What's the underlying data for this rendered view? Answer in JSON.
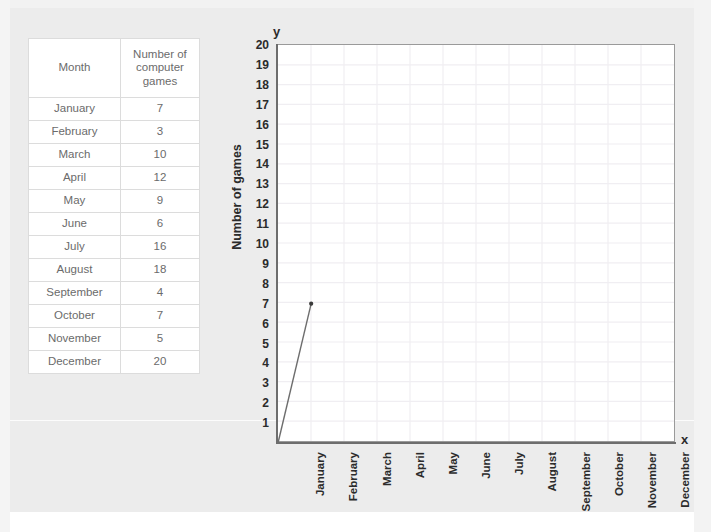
{
  "table": {
    "headers": [
      "Month",
      "Number of computer games"
    ],
    "header_month": "Month",
    "header_value_line1": "Number of",
    "header_value_line2": "computer",
    "header_value_line3": "games",
    "rows": [
      {
        "month": "January",
        "value": "7"
      },
      {
        "month": "February",
        "value": "3"
      },
      {
        "month": "March",
        "value": "10"
      },
      {
        "month": "April",
        "value": "12"
      },
      {
        "month": "May",
        "value": "9"
      },
      {
        "month": "June",
        "value": "6"
      },
      {
        "month": "July",
        "value": "16"
      },
      {
        "month": "August",
        "value": "18"
      },
      {
        "month": "September",
        "value": "4"
      },
      {
        "month": "October",
        "value": "7"
      },
      {
        "month": "November",
        "value": "5"
      },
      {
        "month": "December",
        "value": "20"
      }
    ]
  },
  "chart_axis": {
    "y_letter": "y",
    "x_letter": "x",
    "y_title": "Number of games",
    "y_ticks": [
      "20",
      "19",
      "18",
      "17",
      "16",
      "15",
      "14",
      "13",
      "12",
      "11",
      "10",
      "9",
      "8",
      "7",
      "6",
      "5",
      "4",
      "3",
      "2",
      "1"
    ],
    "x_ticks": [
      "January",
      "February",
      "March",
      "April",
      "May",
      "June",
      "July",
      "August",
      "September",
      "October",
      "November",
      "December"
    ]
  },
  "chart_data": {
    "type": "line",
    "title": "",
    "xlabel": "",
    "ylabel": "Number of games",
    "categories": [
      "January",
      "February",
      "March",
      "April",
      "May",
      "June",
      "July",
      "August",
      "September",
      "October",
      "November",
      "December"
    ],
    "values": [
      7,
      3,
      10,
      12,
      9,
      6,
      16,
      18,
      4,
      7,
      5,
      20
    ],
    "plotted_points": [
      {
        "x": "January",
        "y": 7
      }
    ],
    "plotted_segment_origin": {
      "x": 0,
      "y": 0
    },
    "ylim": [
      0,
      20
    ],
    "ytick_step": 1,
    "grid": true,
    "legend": "none",
    "series_color": "#6d6d6d",
    "marker": "dot"
  },
  "colors": {
    "page_background": "#ececec",
    "plot_background": "#ffffff",
    "axis": "#6d6d6d",
    "grid": "#f0eef2",
    "table_text": "#6b6b6b",
    "table_border": "#dcdcdc",
    "axis_text": "#2b2b2b"
  }
}
